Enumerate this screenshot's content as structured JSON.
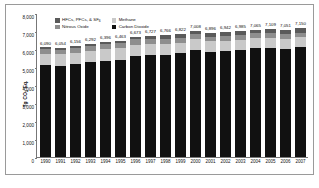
{
  "chart_data": {
    "type": "bar",
    "subtype": "stacked-bar",
    "title": "",
    "xlabel": "",
    "ylabel": "Tg CO2 Eq.",
    "ylim": [
      0,
      8000
    ],
    "ytick_labels": [
      "8,000",
      "7,000",
      "6,000",
      "5,000",
      "4,000",
      "3,000",
      "2,000",
      "1,000",
      "0"
    ],
    "ytick_values": [
      8000,
      7000,
      6000,
      5000,
      4000,
      3000,
      2000,
      1000,
      0
    ],
    "grid": false,
    "legend_position": "top-left-inside",
    "categories": [
      "1990",
      "1991",
      "1992",
      "1993",
      "1994",
      "1995",
      "1996",
      "1997",
      "1998",
      "1999",
      "2000",
      "2001",
      "2002",
      "2003",
      "2004",
      "2005",
      "2006",
      "2007"
    ],
    "series": [
      {
        "name": "Carbon Dioxide",
        "color": "#111111",
        "values": [
          5100,
          5068,
          5164,
          5287,
          5354,
          5408,
          5614,
          5679,
          5688,
          5760,
          5949,
          5842,
          5884,
          5930,
          6037,
          6078,
          6003,
          6103
        ]
      },
      {
        "name": "Methane",
        "color": "#c9c9c9",
        "values": [
          640,
          637,
          640,
          630,
          634,
          636,
          634,
          620,
          608,
          598,
          592,
          582,
          583,
          575,
          567,
          562,
          556,
          545
        ]
      },
      {
        "name": "Nitrous Oxide",
        "color": "#8e8e8e",
        "values": [
          260,
          259,
          270,
          265,
          288,
          288,
          286,
          285,
          286,
          275,
          277,
          267,
          271,
          268,
          274,
          269,
          263,
          264
        ]
      },
      {
        "name": "HFCs, PFCs, & SF6",
        "color": "#5a5a5a",
        "values": [
          90,
          90,
          82,
          110,
          120,
          131,
          139,
          143,
          184,
          189,
          190,
          205,
          204,
          212,
          187,
          200,
          229,
          238
        ]
      }
    ],
    "totals": [
      "6,090",
      "6,054",
      "6,156",
      "6,292",
      "6,396",
      "6,463",
      "6,673",
      "6,727",
      "6,766",
      "6,822",
      "7,008",
      "6,896",
      "6,942",
      "6,985",
      "7,065",
      "7,109",
      "7,051",
      "7,150"
    ],
    "total_values": [
      6090,
      6054,
      6156,
      6292,
      6396,
      6463,
      6673,
      6727,
      6766,
      6822,
      7008,
      6896,
      6942,
      6985,
      7065,
      7109,
      7051,
      7150
    ],
    "legend": [
      {
        "label": "HFCs, PFCs, & SF6",
        "color": "#5a5a5a"
      },
      {
        "label": "Methane",
        "color": "#c9c9c9"
      },
      {
        "label": "Nitrous Oxide",
        "color": "#8e8e8e"
      },
      {
        "label": "Carbon Dioxide",
        "color": "#111111"
      }
    ]
  }
}
